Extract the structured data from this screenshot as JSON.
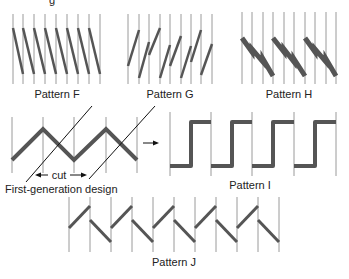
{
  "figure": {
    "top_cropped_text": "g",
    "colors": {
      "background": "#ffffff",
      "grid_line": "#9a9a9a",
      "band": "#555555",
      "annotation": "#111111"
    },
    "patterns": [
      {
        "id": "F",
        "label": "Pattern F",
        "type": "descending-diagonal",
        "cells": 8
      },
      {
        "id": "G",
        "label": "Pattern G",
        "type": "ascending-staggered-diagonal",
        "cells": 8
      },
      {
        "id": "H",
        "label": "Pattern H",
        "type": "descending-grouped-diagonal",
        "cells": 9
      },
      {
        "id": "first-gen",
        "label": "First-generation design",
        "type": "zigzag",
        "cells": 4
      },
      {
        "id": "I",
        "label": "Pattern I",
        "type": "square-wave",
        "cells": 4
      },
      {
        "id": "J",
        "label": "Pattern J",
        "type": "alternating-diagonal",
        "cells": 10
      }
    ],
    "annotations": {
      "cut_label": "cut"
    }
  }
}
